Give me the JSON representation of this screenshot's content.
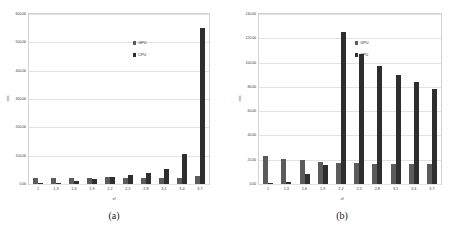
{
  "figure": {
    "panels": [
      {
        "caption": "(a)",
        "title": "Hy=40, Hu=39",
        "xlabel": "vf",
        "ylabel": "sec",
        "legend": [
          {
            "label": "GPU",
            "color": "#5b5b5b"
          },
          {
            "label": "CPU",
            "color": "#2e2e2e"
          }
        ],
        "yticks": [
          "600.00",
          "500.00",
          "400.00",
          "300.00",
          "200.00",
          "100.00",
          "0.00"
        ],
        "xticks": [
          "1",
          "1.3",
          "1.6",
          "1.9",
          "2.2",
          "2.5",
          "2.8",
          "3.1",
          "3.4",
          "3.7"
        ]
      },
      {
        "caption": "(b)",
        "title": "Hy=30, Hu=29",
        "xlabel": "vf",
        "ylabel": "sec",
        "legend": [
          {
            "label": "GPU",
            "color": "#5b5b5b"
          },
          {
            "label": "CPU",
            "color": "#2e2e2e"
          }
        ],
        "yticks": [
          "140.00",
          "120.00",
          "100.00",
          "80.00",
          "60.00",
          "40.00",
          "20.00",
          "0.00"
        ],
        "xticks": [
          "1",
          "1.3",
          "1.6",
          "1.9",
          "2.2",
          "2.5",
          "2.8",
          "3.1",
          "3.4",
          "3.7"
        ]
      }
    ]
  },
  "chart_data": [
    {
      "type": "bar",
      "title": "Hy=40, Hu=39",
      "xlabel": "vf",
      "ylabel": "sec",
      "categories": [
        "1",
        "1.3",
        "1.6",
        "1.9",
        "2.2",
        "2.5",
        "2.8",
        "3.1",
        "3.4",
        "3.7"
      ],
      "series": [
        {
          "name": "GPU",
          "color": "#5b5b5b",
          "values": [
            22,
            22,
            20,
            21,
            23,
            21,
            21,
            21,
            21,
            28
          ]
        },
        {
          "name": "CPU",
          "color": "#2e2e2e",
          "values": [
            3,
            5,
            11,
            19,
            26,
            33,
            40,
            53,
            107,
            550
          ]
        }
      ],
      "ylim": [
        0,
        600
      ],
      "ytick_step": 100,
      "grid": true,
      "legend_position": "inside-right"
    },
    {
      "type": "bar",
      "title": "Hy=30, Hu=29",
      "xlabel": "vf",
      "ylabel": "sec",
      "categories": [
        "1",
        "1.3",
        "1.6",
        "1.9",
        "2.2",
        "2.5",
        "2.8",
        "3.1",
        "3.4",
        "3.7"
      ],
      "series": [
        {
          "name": "GPU",
          "color": "#5b5b5b",
          "values": [
            23,
            21,
            19.5,
            18,
            17,
            17,
            16.5,
            16.5,
            16.5,
            16.5
          ]
        },
        {
          "name": "CPU",
          "color": "#2e2e2e",
          "values": [
            1,
            1.5,
            8,
            16,
            125,
            107,
            97,
            90,
            84,
            78
          ]
        }
      ],
      "ylim": [
        0,
        140
      ],
      "ytick_step": 20,
      "grid": true,
      "legend_position": "inside-right"
    }
  ]
}
